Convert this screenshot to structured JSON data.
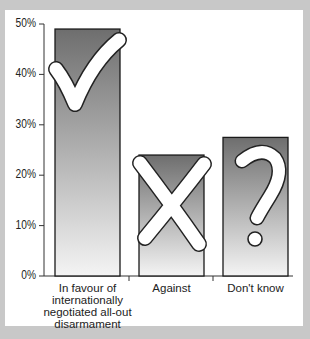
{
  "chart_data": {
    "type": "bar",
    "title": "",
    "xlabel": "",
    "ylabel": "",
    "categories": [
      "In favour of internationally negotiated all-out disarmament",
      "Against",
      "Don't know"
    ],
    "category_lines": [
      [
        "In favour of",
        "internationally",
        "negotiated all-out",
        "disarmament"
      ],
      [
        "Against"
      ],
      [
        "Don't know"
      ]
    ],
    "values": [
      49,
      24,
      27.5
    ],
    "ylim": [
      0,
      50
    ],
    "yticks": [
      0,
      10,
      20,
      30,
      40,
      50
    ],
    "ytick_labels": [
      "0%",
      "10%",
      "20%",
      "30%",
      "40%",
      "50%"
    ],
    "grid": false,
    "legend": null,
    "bar_icons": [
      "check-mark",
      "cross-mark",
      "question-mark"
    ]
  },
  "colors": {
    "background": "#c8c8c8",
    "panel": "#ffffff",
    "bar_top": "#6e6e6e",
    "bar_bottom": "#f2f2f2",
    "outline": "#1a1a1a"
  }
}
